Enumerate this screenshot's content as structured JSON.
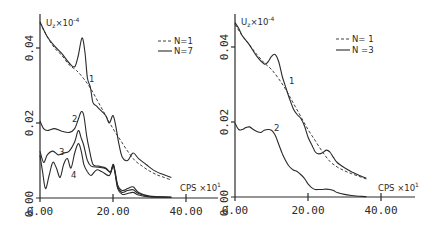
{
  "chart_data": [
    {
      "type": "line",
      "panel": "left",
      "title": "",
      "ylabel": "U_z × 10^-4",
      "xlabel": "CPS × 10^1",
      "xlim": [
        0,
        40
      ],
      "ylim": [
        0,
        0.045
      ],
      "x_ticks": [
        "0.00",
        "20.00",
        "40.00"
      ],
      "y_ticks": [
        "0.00",
        "0.02",
        "0.04"
      ],
      "legend": [
        {
          "label": "N=1",
          "style": "dashed"
        },
        {
          "label": "N=7",
          "style": "solid"
        }
      ],
      "grid": false,
      "series": [
        {
          "name": "N=1 curve 1",
          "style": "dashed",
          "points": [
            [
              0,
              0.0467
            ],
            [
              2,
              0.043
            ],
            [
              4,
              0.04
            ],
            [
              6,
              0.038
            ],
            [
              8,
              0.0355
            ],
            [
              10,
              0.034
            ],
            [
              12,
              0.0318
            ],
            [
              14,
              0.029
            ],
            [
              16,
              0.0255
            ],
            [
              18,
              0.022
            ],
            [
              20,
              0.0185
            ],
            [
              22,
              0.0155
            ],
            [
              24,
              0.0125
            ],
            [
              26,
              0.01
            ],
            [
              28,
              0.0085
            ],
            [
              30,
              0.0072
            ],
            [
              32,
              0.0062
            ],
            [
              34,
              0.0055
            ],
            [
              36,
              0.0048
            ]
          ]
        },
        {
          "name": "N=7 curve 1",
          "label": "1",
          "style": "solid",
          "points": [
            [
              0,
              0.047
            ],
            [
              2,
              0.043
            ],
            [
              4,
              0.0405
            ],
            [
              6,
              0.0385
            ],
            [
              8,
              0.036
            ],
            [
              9.5,
              0.035
            ],
            [
              10.5,
              0.038
            ],
            [
              11.5,
              0.0427
            ],
            [
              12.3,
              0.039
            ],
            [
              13,
              0.032
            ],
            [
              13.8,
              0.0295
            ],
            [
              14.5,
              0.0255
            ],
            [
              15.5,
              0.0245
            ],
            [
              16.5,
              0.0235
            ],
            [
              18,
              0.022
            ],
            [
              19,
              0.02
            ],
            [
              20,
              0.022
            ],
            [
              20.8,
              0.019
            ],
            [
              21.5,
              0.015
            ],
            [
              22.5,
              0.011
            ],
            [
              24,
              0.01
            ],
            [
              25.5,
              0.012
            ],
            [
              27,
              0.0105
            ],
            [
              29,
              0.009
            ],
            [
              31,
              0.0075
            ],
            [
              33,
              0.0065
            ],
            [
              36,
              0.0055
            ]
          ]
        },
        {
          "name": "N=7 curve 2",
          "label": "2",
          "style": "solid",
          "points": [
            [
              0,
              0.0205
            ],
            [
              1,
              0.0185
            ],
            [
              2,
              0.018
            ],
            [
              4,
              0.0185
            ],
            [
              6,
              0.0178
            ],
            [
              8,
              0.0175
            ],
            [
              9.5,
              0.0185
            ],
            [
              10.5,
              0.021
            ],
            [
              11.3,
              0.023
            ],
            [
              12,
              0.022
            ],
            [
              12.8,
              0.0165
            ],
            [
              13.5,
              0.013
            ],
            [
              14.5,
              0.009
            ],
            [
              16,
              0.0085
            ],
            [
              18,
              0.008
            ],
            [
              19.3,
              0.007
            ],
            [
              20,
              0.009
            ],
            [
              20.5,
              0.0075
            ],
            [
              21.3,
              0.0035
            ],
            [
              22.5,
              0.002
            ],
            [
              24,
              0.0025
            ],
            [
              25.5,
              0.003
            ],
            [
              27,
              0.0015
            ],
            [
              30,
              0.0005
            ],
            [
              36,
              0.0002
            ]
          ]
        },
        {
          "name": "N=7 curve 3",
          "label": "3",
          "style": "solid",
          "points": [
            [
              0,
              0.0125
            ],
            [
              1,
              0.0095
            ],
            [
              2,
              0.0115
            ],
            [
              3.5,
              0.0125
            ],
            [
              5,
              0.0115
            ],
            [
              6.5,
              0.012
            ],
            [
              8,
              0.0125
            ],
            [
              9.5,
              0.015
            ],
            [
              10.5,
              0.018
            ],
            [
              11.3,
              0.016
            ],
            [
              12,
              0.014
            ],
            [
              13,
              0.01
            ],
            [
              14,
              0.0085
            ],
            [
              16,
              0.0082
            ],
            [
              18,
              0.0078
            ],
            [
              19.3,
              0.0068
            ],
            [
              20,
              0.0088
            ],
            [
              20.5,
              0.0072
            ],
            [
              21.3,
              0.003
            ],
            [
              22.5,
              0.0015
            ],
            [
              24,
              0.002
            ],
            [
              25.5,
              0.0022
            ],
            [
              27,
              0.0012
            ],
            [
              30,
              0.0004
            ],
            [
              36,
              0.0002
            ]
          ]
        },
        {
          "name": "N=7 curve 4",
          "label": "4",
          "style": "solid",
          "points": [
            [
              0,
              0.0115
            ],
            [
              0.7,
              0.007
            ],
            [
              1.5,
              0.0025
            ],
            [
              2.5,
              0.006
            ],
            [
              3.5,
              0.0095
            ],
            [
              4.5,
              0.008
            ],
            [
              5.5,
              0.0055
            ],
            [
              6.5,
              0.009
            ],
            [
              7.5,
              0.0105
            ],
            [
              8.5,
              0.008
            ],
            [
              9.5,
              0.012
            ],
            [
              10.5,
              0.0145
            ],
            [
              11.3,
              0.0125
            ],
            [
              12,
              0.009
            ],
            [
              13,
              0.007
            ],
            [
              14,
              0.006
            ],
            [
              15.5,
              0.0075
            ],
            [
              17,
              0.007
            ],
            [
              19,
              0.006
            ],
            [
              20,
              0.0085
            ],
            [
              20.5,
              0.007
            ],
            [
              21.3,
              0.0025
            ],
            [
              22.5,
              0.001
            ],
            [
              24,
              0.0012
            ],
            [
              25.5,
              0.0015
            ],
            [
              27,
              0.0008
            ],
            [
              30,
              0.0003
            ],
            [
              36,
              0.0002
            ]
          ]
        }
      ]
    },
    {
      "type": "line",
      "panel": "right",
      "title": "",
      "ylabel": "U_z × 10^-4",
      "xlabel": "CPS × 10^1",
      "xlim": [
        0,
        40
      ],
      "ylim": [
        0,
        0.045
      ],
      "x_ticks": [
        "0.00",
        "20.00",
        "40.00"
      ],
      "y_ticks": [
        "0.00",
        "0.02",
        "0.04"
      ],
      "legend": [
        {
          "label": "N=1",
          "style": "dashed"
        },
        {
          "label": "N=3",
          "style": "solid"
        }
      ],
      "grid": false,
      "series": [
        {
          "name": "N=1 curve 1",
          "style": "dashed",
          "points": [
            [
              0,
              0.046
            ],
            [
              2,
              0.043
            ],
            [
              4,
              0.0405
            ],
            [
              6,
              0.038
            ],
            [
              8,
              0.0358
            ],
            [
              10,
              0.034
            ],
            [
              12,
              0.0315
            ],
            [
              14,
              0.0285
            ],
            [
              16,
              0.025
            ],
            [
              18,
              0.0215
            ],
            [
              20,
              0.018
            ],
            [
              22,
              0.015
            ],
            [
              24,
              0.012
            ],
            [
              26,
              0.0095
            ],
            [
              28,
              0.008
            ],
            [
              30,
              0.007
            ],
            [
              32,
              0.0062
            ],
            [
              34,
              0.0055
            ],
            [
              36,
              0.0048
            ]
          ]
        },
        {
          "name": "N=3 curve 1",
          "label": "1",
          "style": "solid",
          "points": [
            [
              0,
              0.0465
            ],
            [
              1,
              0.045
            ],
            [
              2,
              0.043
            ],
            [
              4,
              0.0405
            ],
            [
              6,
              0.0375
            ],
            [
              8,
              0.0355
            ],
            [
              9,
              0.036
            ],
            [
              10,
              0.0375
            ],
            [
              11,
              0.038
            ],
            [
              12,
              0.036
            ],
            [
              13,
              0.032
            ],
            [
              14,
              0.029
            ],
            [
              15,
              0.026
            ],
            [
              16,
              0.0235
            ],
            [
              17,
              0.022
            ],
            [
              18,
              0.021
            ],
            [
              19,
              0.019
            ],
            [
              20,
              0.016
            ],
            [
              21,
              0.014
            ],
            [
              22,
              0.012
            ],
            [
              23,
              0.0115
            ],
            [
              24,
              0.0118
            ],
            [
              25,
              0.0125
            ],
            [
              26,
              0.012
            ],
            [
              27,
              0.0105
            ],
            [
              28,
              0.0092
            ],
            [
              30,
              0.0078
            ],
            [
              32,
              0.0067
            ],
            [
              34,
              0.0058
            ],
            [
              36,
              0.005
            ]
          ]
        },
        {
          "name": "N=3 curve 2",
          "label": "2",
          "style": "solid",
          "points": [
            [
              0,
              0.0197
            ],
            [
              1,
              0.018
            ],
            [
              2,
              0.018
            ],
            [
              3,
              0.0185
            ],
            [
              4,
              0.0187
            ],
            [
              5,
              0.018
            ],
            [
              6,
              0.0175
            ],
            [
              7,
              0.0172
            ],
            [
              8,
              0.0178
            ],
            [
              9,
              0.018
            ],
            [
              10,
              0.0178
            ],
            [
              11,
              0.0165
            ],
            [
              12,
              0.014
            ],
            [
              13,
              0.0115
            ],
            [
              14,
              0.0095
            ],
            [
              15,
              0.008
            ],
            [
              16,
              0.0072
            ],
            [
              17,
              0.0068
            ],
            [
              18,
              0.006
            ],
            [
              19,
              0.005
            ],
            [
              20,
              0.0035
            ],
            [
              21,
              0.0025
            ],
            [
              22,
              0.002
            ],
            [
              23,
              0.002
            ],
            [
              24,
              0.002
            ],
            [
              25,
              0.0021
            ],
            [
              26,
              0.002
            ],
            [
              27,
              0.0017
            ],
            [
              28,
              0.0012
            ],
            [
              30,
              0.0007
            ],
            [
              32,
              0.0004
            ],
            [
              34,
              0.0002
            ],
            [
              36,
              0.0001
            ]
          ]
        }
      ]
    }
  ],
  "left_panel": {
    "y_unit_label": "U",
    "y_unit_sub": "z",
    "y_unit_mult": "×10",
    "y_unit_exp": "-4",
    "x_unit_label": "CPS ×10",
    "x_unit_exp": "1",
    "legend_dashed": "N=1",
    "legend_solid": "N=7",
    "curve_labels": [
      "1",
      "2",
      "3",
      "4"
    ],
    "x_tick_labels": [
      "0.00",
      "20.00",
      "40.00"
    ],
    "y_tick_labels": [
      "0.00",
      "0.02",
      "0.04"
    ]
  },
  "right_panel": {
    "y_unit_label": "U",
    "y_unit_sub": "z",
    "y_unit_mult": "×10",
    "y_unit_exp": "-4",
    "x_unit_label": "CPS ×10",
    "x_unit_exp": "1",
    "legend_dashed": "N= 1",
    "legend_solid": "N =3",
    "curve_labels": [
      "1",
      "2"
    ],
    "x_tick_labels": [
      "0.00",
      "20.00",
      "40.00"
    ],
    "y_tick_labels": [
      "0.00",
      "0.02",
      "0.04"
    ]
  }
}
